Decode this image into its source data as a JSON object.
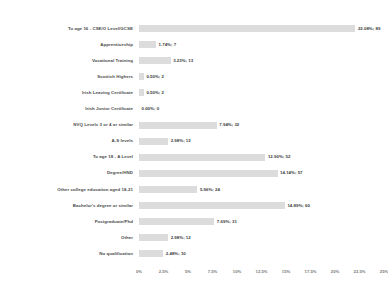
{
  "chart_data": {
    "type": "bar",
    "orientation": "horizontal",
    "title": "",
    "xlabel": "",
    "ylabel": "",
    "xlim": [
      0,
      25
    ],
    "grid": false,
    "legend": "none",
    "bar_color": "#dcdcdc",
    "categories": [
      "To age 16 - CSE/O Level/GCSE",
      "Apprenticeship",
      "Vocational Training",
      "Scottish Highers",
      "Irish Leaving Certificate",
      "Irish Junior Certificate",
      "NVQ Levels 3 or 4 or similar",
      "A-S levels",
      "To age 18 - A Level",
      "Degree/HND",
      "Other college education aged 18-21",
      "Bachelor's degree or similar",
      "Postgraduate/Phd",
      "Other",
      "No qualification"
    ],
    "values": [
      22.08,
      1.74,
      3.23,
      0.5,
      0.5,
      0.0,
      7.94,
      2.98,
      12.9,
      14.14,
      5.96,
      14.89,
      7.69,
      2.98,
      2.48
    ],
    "counts": [
      89,
      7,
      13,
      2,
      2,
      0,
      32,
      12,
      52,
      57,
      24,
      60,
      31,
      12,
      10
    ],
    "data_labels": [
      "22.08%; 89",
      "1.74%; 7",
      "3.23%; 13",
      "0.50%; 2",
      "0.50%; 2",
      "0.00%; 0",
      "7.94%; 32",
      "2.98%; 12",
      "12.90%; 52",
      "14.14%; 57",
      "5.96%; 24",
      "14.89%; 60",
      "7.69%; 31",
      "2.98%; 12",
      "2.48%; 10"
    ],
    "xticks": [
      0,
      2.5,
      5,
      7.5,
      10,
      12.5,
      15,
      17.5,
      20,
      22.5,
      25
    ],
    "xticklabels": [
      "0%",
      "2.5%",
      "5%",
      "7.5%",
      "10%",
      "12.5%",
      "15%",
      "17.5%",
      "20%",
      "22.5%",
      "25%"
    ]
  }
}
